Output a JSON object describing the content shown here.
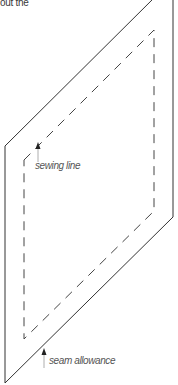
{
  "caption": {
    "text": "out the"
  },
  "diagram": {
    "outer_stroke_color": "#333333",
    "dashed_stroke_color": "#444444",
    "arrow_color": "#222222",
    "label_color": "#555555"
  },
  "labels": {
    "sewing_line": "sewing line",
    "seam_allowance": "seam allowance"
  }
}
